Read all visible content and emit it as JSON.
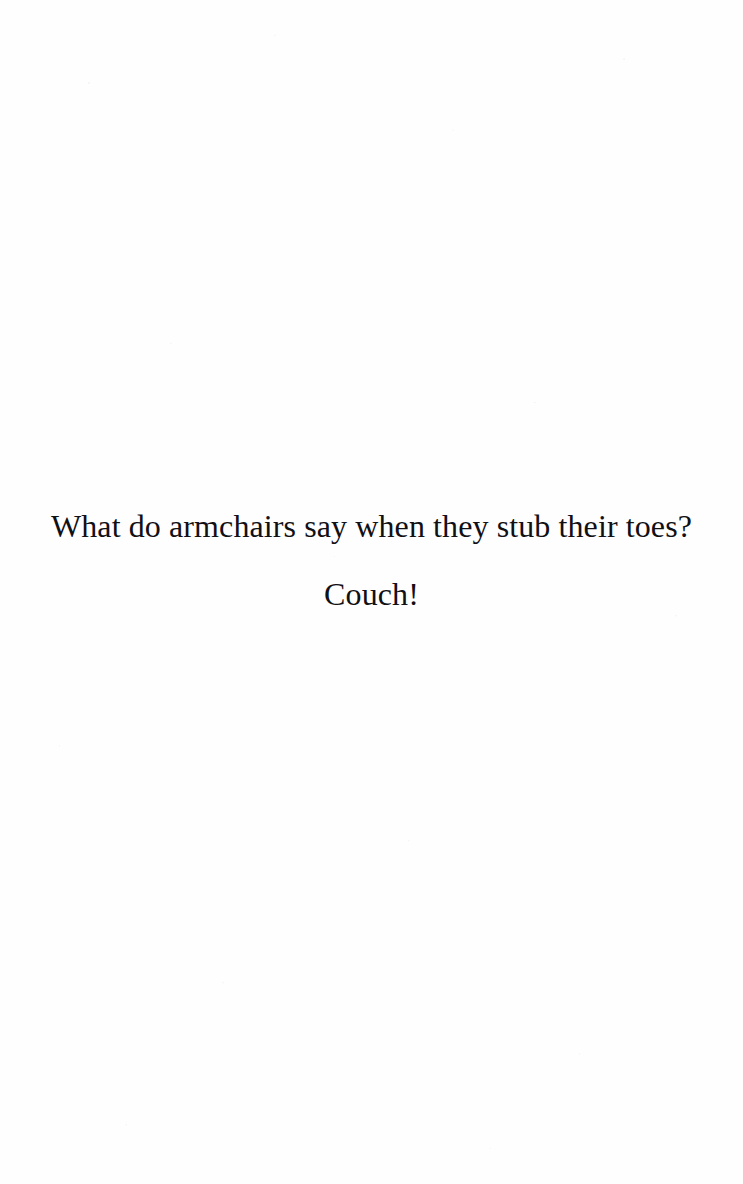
{
  "page": {
    "kind": "scanned-joke-page",
    "background_color": "#fefeff",
    "ink_color": "#111014"
  },
  "joke": {
    "question": "What do armchairs say when they stub their toes?",
    "punchline": "Couch!"
  }
}
